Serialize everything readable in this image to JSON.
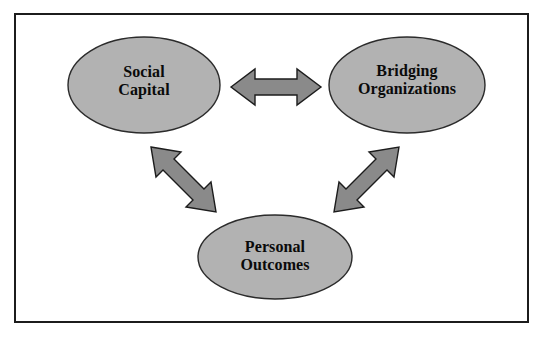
{
  "figure": {
    "type": "concept-diagram",
    "frame": {
      "border_color": "#1c1c1c",
      "background_color": "#ffffff"
    },
    "palette": {
      "node_fill": "#b2b2b2",
      "node_stroke": "#2b2b2b",
      "arrow_fill": "#8a8a8a",
      "arrow_stroke": "#1c1c1c",
      "text_color": "#0a0a0a"
    }
  },
  "nodes": [
    {
      "id": "social-capital",
      "label": "Social\nCapital",
      "shape": "ellipse",
      "fill": "#b2b2b2"
    },
    {
      "id": "bridging-organizations",
      "label": "Bridging\nOrganizations",
      "shape": "ellipse",
      "fill": "#b2b2b2"
    },
    {
      "id": "personal-outcomes",
      "label": "Personal\nOutcomes",
      "shape": "ellipse",
      "fill": "#b2b2b2"
    }
  ],
  "connectors": [
    {
      "id": "social-capital-to-bridging-organizations",
      "from": "social-capital",
      "to": "bridging-organizations",
      "style": "double-headed-arrow",
      "orientation": "horizontal"
    },
    {
      "id": "social-capital-to-personal-outcomes",
      "from": "social-capital",
      "to": "personal-outcomes",
      "style": "double-headed-arrow",
      "orientation": "diagonal-down-right"
    },
    {
      "id": "bridging-organizations-to-personal-outcomes",
      "from": "bridging-organizations",
      "to": "personal-outcomes",
      "style": "double-headed-arrow",
      "orientation": "diagonal-down-left"
    }
  ]
}
